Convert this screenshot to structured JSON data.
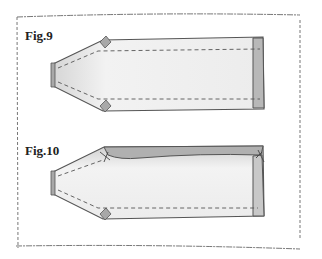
{
  "figures": [
    {
      "label": "Fig.9",
      "description": "Sleeve piece with corner tabs, dashed stitching lines, narrow folded cuff strip at right"
    },
    {
      "label": "Fig.10",
      "description": "Sleeve piece with top edge folded over (shaded hem), pins at top corners, dashed stitching line at bottom"
    }
  ],
  "colors": {
    "fabric_fill": "#ececec",
    "fabric_edge": "#555555",
    "fold_fill": "#b8b8b8",
    "tab_fill": "#a8a8a8",
    "stitch": "#555555",
    "frame": "#666666"
  }
}
